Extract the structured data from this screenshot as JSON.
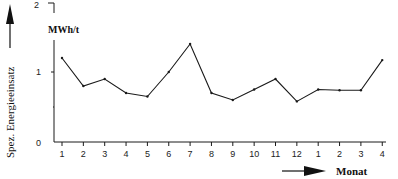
{
  "chart_data": {
    "type": "line",
    "title": "",
    "xlabel": "Monat",
    "ylabel": "Spez. Energieeinsatz",
    "yunit": "MWh/t",
    "ylim": [
      0,
      2
    ],
    "yticks": [
      "0",
      "1",
      "2"
    ],
    "categories": [
      "1",
      "2",
      "3",
      "4",
      "5",
      "6",
      "7",
      "8",
      "9",
      "10",
      "11",
      "12",
      "1",
      "2",
      "3",
      "4"
    ],
    "series": [
      {
        "name": "Spez. Energieeinsatz",
        "values": [
          1.2,
          0.8,
          0.9,
          0.7,
          0.65,
          1.0,
          1.4,
          0.7,
          0.6,
          0.75,
          0.9,
          0.58,
          0.75,
          0.74,
          0.74,
          1.17
        ]
      }
    ],
    "grid": false,
    "legend": "none"
  },
  "labels": {
    "yaxis_title": "Spez. Energieeinsatz",
    "yaxis_unit": "MWh/t",
    "xaxis_title": "Monat",
    "y0": "0",
    "y1": "1",
    "y2": "2"
  },
  "colors": {
    "line": "#1a1a1a",
    "axis": "#1a1a1a",
    "background": "#ffffff"
  }
}
